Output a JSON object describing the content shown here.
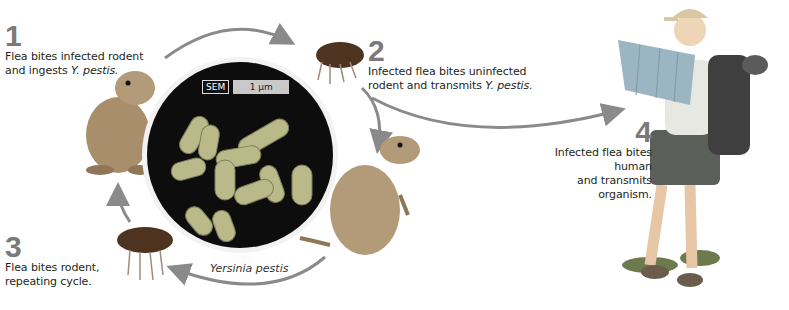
{
  "diagram": {
    "steps": [
      {
        "number": "1",
        "text_line1": "Flea bites infected rodent",
        "text_line2_prefix": "and ingests ",
        "text_line2_italic": "Y. pestis."
      },
      {
        "number": "2",
        "text_line1": "Infected flea bites uninfected",
        "text_line2_prefix": "rodent and transmits ",
        "text_line2_italic": "Y. pestis."
      },
      {
        "number": "3",
        "text_line1": "Flea bites rodent,",
        "text_line2_prefix": "repeating cycle.",
        "text_line2_italic": ""
      },
      {
        "number": "4",
        "text_line1": "Infected flea bites human",
        "text_line2_prefix": "and transmits organism.",
        "text_line2_italic": ""
      }
    ],
    "micrograph": {
      "label": "SEM",
      "scale": "1 μm",
      "caption": "Yersinia pestis"
    },
    "colors": {
      "arrow": "#8a8a8a",
      "step_number": "#7a7a7a",
      "micrograph_bg": "#0d0d0d",
      "bacteria": "#b9b98a",
      "rodent": "#b39a78",
      "flea": "#5a3d24"
    }
  }
}
